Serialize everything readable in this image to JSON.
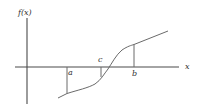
{
  "diagram": {
    "type": "function-graph",
    "labels": {
      "y_axis": "f(x)",
      "x_axis": "x",
      "point_a": "a",
      "point_b": "b",
      "point_c": "c"
    },
    "points": [
      {
        "name": "a",
        "f_sign": "negative"
      },
      {
        "name": "c",
        "f_sign": "near zero, left of root"
      },
      {
        "name": "b",
        "f_sign": "positive"
      }
    ],
    "colors": {
      "axis": "#4a4a4a",
      "curve": "#6a6a6a",
      "text": "#333333",
      "background": "#ffffff"
    }
  }
}
